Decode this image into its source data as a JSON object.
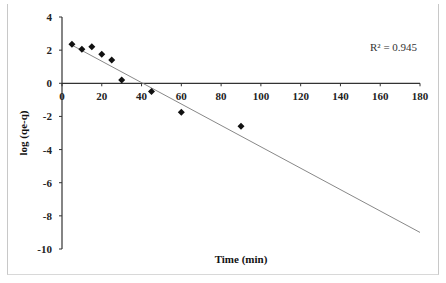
{
  "chart_data": {
    "type": "scatter",
    "title": "",
    "xlabel": "Time (min)",
    "ylabel": "log (qe-q)",
    "xlim": [
      0,
      180
    ],
    "ylim": [
      -10,
      4
    ],
    "x_ticks": [
      0,
      20,
      40,
      60,
      80,
      100,
      120,
      140,
      160,
      180
    ],
    "y_ticks": [
      4,
      2,
      0,
      -2,
      -4,
      -6,
      -8,
      -10
    ],
    "grid": false,
    "legend": null,
    "annotations": [
      {
        "text": "R² = 0.945",
        "position": "upper-right"
      }
    ],
    "series": [
      {
        "name": "data",
        "marker": "diamond",
        "x": [
          5,
          10,
          15,
          20,
          25,
          30,
          45,
          60,
          90
        ],
        "y": [
          2.35,
          2.05,
          2.2,
          1.75,
          1.4,
          0.2,
          -0.5,
          -1.75,
          -2.6
        ]
      },
      {
        "name": "linear fit",
        "type": "line",
        "x": [
          5,
          180
        ],
        "y": [
          2.3,
          -9.0
        ]
      }
    ]
  },
  "labels": {
    "xlabel": "Time (min)",
    "ylabel": "log (qe-q)",
    "r2": "R² = 0.945"
  }
}
